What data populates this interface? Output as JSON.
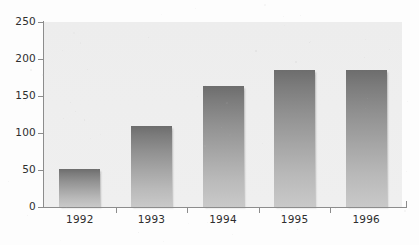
{
  "chart_data": {
    "type": "bar",
    "title": "",
    "subtitle": "",
    "xlabel": "",
    "ylabel": "",
    "categories": [
      "1992",
      "1993",
      "1994",
      "1995",
      "1996"
    ],
    "values": [
      51,
      110,
      163,
      185,
      185
    ],
    "series": [
      {
        "name": "",
        "values": [
          51,
          110,
          163,
          185,
          185
        ]
      }
    ],
    "ylim": [
      0,
      250
    ],
    "y_ticks": [
      0,
      50,
      100,
      150,
      200,
      250
    ],
    "y_tick_labels": [
      "0",
      "50",
      "100",
      "150",
      "200",
      "250"
    ],
    "grid": false,
    "legend": false,
    "legend_position": "none",
    "annotations": [],
    "colors": {
      "bar_gradient_top": "#6d6d6d",
      "bar_gradient_bottom": "#c9c9c9",
      "plot_background": "#eeeeee",
      "figure_background": "#fdfdfd",
      "axis_line": "#8c8c8c",
      "tick_label_text": "#2e2e2e"
    }
  }
}
